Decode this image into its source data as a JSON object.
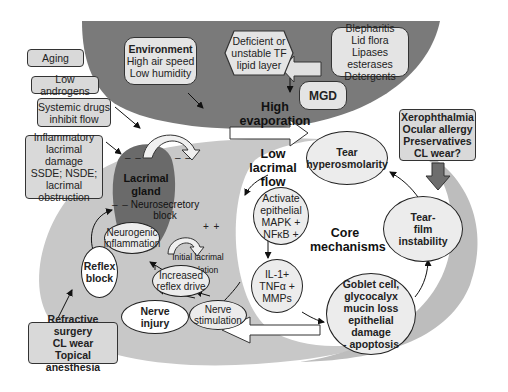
{
  "colors": {
    "dark_gray_region": "#7a7a7a",
    "light_gray_region": "#c8c8c8",
    "white_region": "#ffffff",
    "lacrimal_gland": "#6a6a6a",
    "box_fill": "#d9d9d9",
    "xerophthalmia_arrow": "#6e6e6e"
  },
  "risk_factors_left": {
    "aging": "Aging",
    "low_androgens": "Low androgens",
    "systemic_drugs": [
      "Systemic drugs",
      "inhibit flow"
    ],
    "inflammatory": [
      "Inflammatory",
      "lacrimal damage",
      "SSDE; NSDE;",
      "lacrimal",
      "obstruction"
    ],
    "refractive": [
      "Refractive surgery",
      "CL wear",
      "Topical anesthesia"
    ]
  },
  "top_region": {
    "environment": {
      "title": "Environment",
      "lines": [
        "High air speed",
        "Low humidity"
      ]
    },
    "tf_lipid": [
      "Deficient or",
      "unstable TF",
      "lipid layer"
    ],
    "blepharitis": [
      "Blepharitis",
      "Lid flora",
      "Lipases esterases",
      "Detergents"
    ],
    "mgd": "MGD",
    "high_evaporation": [
      "High",
      "evaporation"
    ]
  },
  "middle": {
    "low_lacrimal_flow": [
      "Low",
      "lacrimal",
      "flow"
    ],
    "lacrimal_gland": [
      "Lacrimal",
      "gland"
    ],
    "neurosecretory_block": [
      "Neurosecretory",
      "block"
    ],
    "neurogenic_inflammation": [
      "Neurogenic",
      "inflammation"
    ],
    "initial_lacrimal_stimulation": "Initial lacrimal stimulation",
    "increased_reflex_drive": [
      "Increased",
      "reflex drive"
    ],
    "reflex_block": [
      "Reflex",
      "block"
    ],
    "nerve_injury": [
      "Nerve",
      "injury"
    ],
    "nerve_stimulation": [
      "Nerve",
      "stimulation"
    ],
    "minus_signs": "– –",
    "plus_signs": "+ +"
  },
  "core": {
    "title": [
      "Core",
      "mechanisms"
    ],
    "tear_hyperosmolarity": [
      "Tear",
      "hyperosmolarity"
    ],
    "activate_epithelial": [
      "Activate",
      "epithelial",
      "MAPK +",
      "NFκB +"
    ],
    "cytokines": [
      "IL-1+",
      "TNFα +",
      "MMPs"
    ],
    "goblet_cell": [
      "Goblet cell,",
      "glycocalyx",
      "mucin loss",
      "epithelial damage",
      "- apoptosis"
    ],
    "tear_film_instability": [
      "Tear-",
      "film",
      "instability"
    ]
  },
  "right_factors": {
    "xerophthalmia": [
      "Xerophthalmia",
      "Ocular allergy",
      "Preservatives",
      "CL wear?"
    ]
  }
}
